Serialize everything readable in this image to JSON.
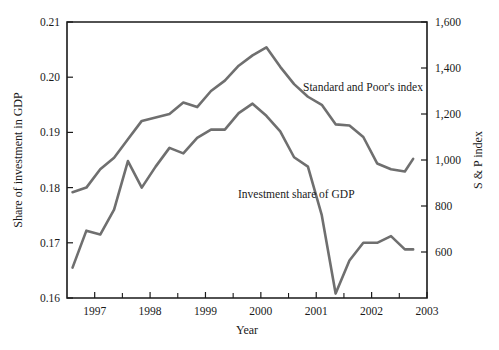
{
  "chart_data": {
    "type": "line",
    "title": "",
    "xlabel": "Year",
    "ylabel": "Share of investment in GDP",
    "y2label": "S & P index",
    "xlim": [
      1996.5,
      2003.0
    ],
    "ylim": [
      0.16,
      0.21
    ],
    "y2lim": [
      400,
      1600
    ],
    "grid": false,
    "legend_position": "inline-annotation",
    "xticks": [
      "1997",
      "1998",
      "1999",
      "2000",
      "2001",
      "2002",
      "2003"
    ],
    "xtick_values": [
      1997,
      1998,
      1999,
      2000,
      2001,
      2002,
      2003
    ],
    "xminor_ticks": [
      1997.5,
      1998.5,
      1999.5,
      2000.5,
      2001.5,
      2002.5
    ],
    "yticks": [
      "0.16",
      "0.17",
      "0.18",
      "0.19",
      "0.20",
      "0.21"
    ],
    "ytick_values": [
      0.16,
      0.17,
      0.18,
      0.19,
      0.2,
      0.21
    ],
    "y2ticks": [
      "600",
      "800",
      "1,000",
      "1,200",
      "1,400",
      "1,600"
    ],
    "y2tick_values": [
      600,
      800,
      1000,
      1200,
      1400,
      1600
    ],
    "series": [
      {
        "name": "Standard and Poor's index",
        "axis": "right",
        "color": "#6f6f6f",
        "annotation": "Standard and Poor's index",
        "x": [
          1996.6,
          1996.85,
          1997.1,
          1997.35,
          1997.6,
          1997.85,
          1998.1,
          1998.35,
          1998.6,
          1998.85,
          1999.1,
          1999.35,
          1999.6,
          1999.85,
          2000.1,
          2000.35,
          2000.6,
          2000.85,
          2001.1,
          2001.35,
          2001.6,
          2001.85,
          2002.1,
          2002.35,
          2002.6,
          2002.75
        ],
        "values": [
          860,
          880,
          960,
          1010,
          1090,
          1170,
          1185,
          1200,
          1250,
          1230,
          1300,
          1345,
          1410,
          1455,
          1490,
          1405,
          1330,
          1275,
          1240,
          1155,
          1150,
          1100,
          985,
          960,
          950,
          1005
        ]
      },
      {
        "name": "Investment share of GDP",
        "axis": "left",
        "color": "#6f6f6f",
        "annotation": "Investment share of GDP",
        "x": [
          1996.6,
          1996.85,
          1997.1,
          1997.35,
          1997.6,
          1997.85,
          1998.1,
          1998.35,
          1998.6,
          1998.85,
          1999.1,
          1999.35,
          1999.6,
          1999.85,
          2000.1,
          2000.35,
          2000.6,
          2000.85,
          2001.1,
          2001.35,
          2001.6,
          2001.85,
          2002.1,
          2002.35,
          2002.6,
          2002.75
        ],
        "values": [
          0.1655,
          0.1722,
          0.1715,
          0.176,
          0.1848,
          0.18,
          0.1838,
          0.1872,
          0.1862,
          0.189,
          0.1905,
          0.1905,
          0.1935,
          0.1952,
          0.193,
          0.1902,
          0.1855,
          0.1838,
          0.175,
          0.1608,
          0.1668,
          0.17,
          0.17,
          0.1712,
          0.1688,
          0.1688
        ]
      }
    ],
    "annotations": [
      {
        "text": "Standard and Poor's index",
        "x_px": 303,
        "y_px": 91
      },
      {
        "text": "Investment share of GDP",
        "x_px": 238,
        "y_px": 198
      }
    ],
    "caption": ""
  }
}
